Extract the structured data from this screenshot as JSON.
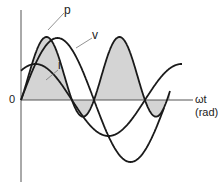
{
  "diagram": {
    "curves": [
      {
        "name": "p",
        "label": "p",
        "description": "instantaneous power, shaded"
      },
      {
        "name": "v",
        "label": "v",
        "description": "voltage waveform"
      },
      {
        "name": "i",
        "label": "i",
        "description": "current waveform"
      }
    ],
    "origin_label": "0",
    "x_axis": {
      "label": "ωt",
      "unit": "(rad)"
    },
    "colors": {
      "stroke": "#1a1a1a",
      "fill": "#d4d4d4",
      "axis": "#555555"
    }
  }
}
